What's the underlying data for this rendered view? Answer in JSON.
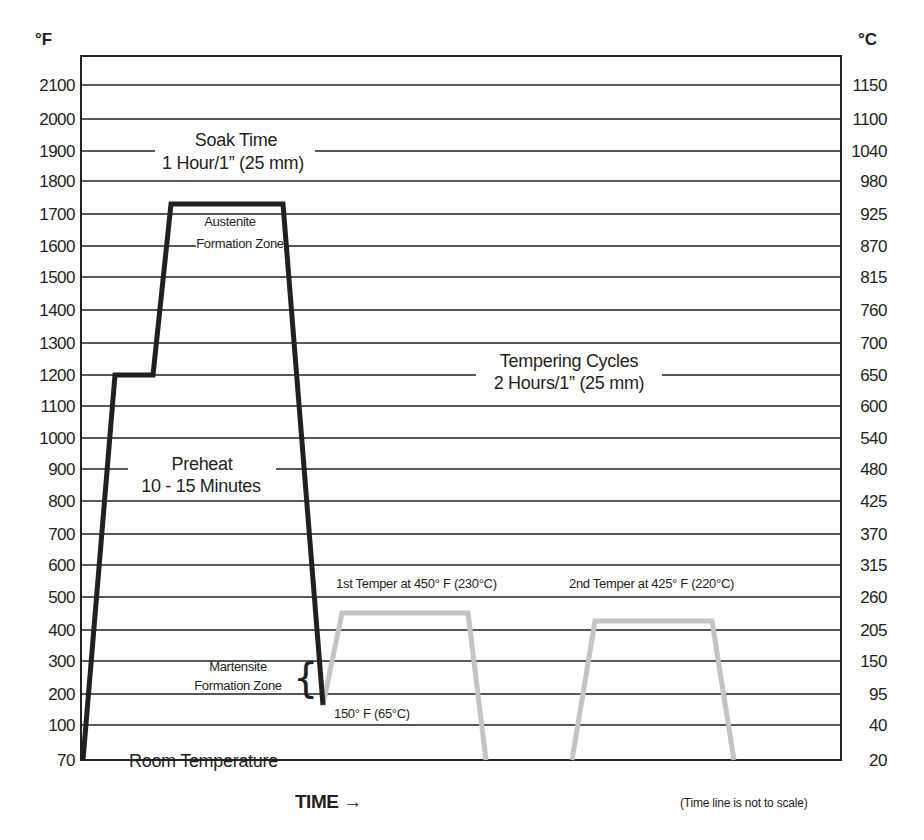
{
  "chart_data": {
    "type": "line",
    "title": "",
    "xlabel": "TIME →",
    "ylabel_left": "°F",
    "ylabel_right": "°C",
    "note": "(Time line is not to scale)",
    "grid": true,
    "y_ticks_f": [
      70,
      100,
      200,
      300,
      400,
      500,
      600,
      700,
      800,
      900,
      1000,
      1100,
      1200,
      1300,
      1400,
      1500,
      1600,
      1700,
      1800,
      1900,
      2000,
      2100
    ],
    "y_ticks_c": [
      20,
      40,
      95,
      150,
      205,
      260,
      315,
      370,
      425,
      480,
      540,
      600,
      650,
      700,
      760,
      815,
      870,
      925,
      980,
      1040,
      1100,
      1150
    ],
    "ylim_f": [
      70,
      2200
    ],
    "series": [
      {
        "name": "Hardening cycle",
        "color": "#231f20",
        "points_f": [
          {
            "stage": "Room Temperature start",
            "temp_f": 70
          },
          {
            "stage": "Preheat",
            "temp_f": 1200
          },
          {
            "stage": "Preheat hold end",
            "temp_f": 1200
          },
          {
            "stage": "Austenite Formation (soak)",
            "temp_f": 1730
          },
          {
            "stage": "Soak end",
            "temp_f": 1730
          },
          {
            "stage": "Quench to",
            "temp_f": 150
          }
        ]
      },
      {
        "name": "1st Temper",
        "color": "#c8c8c8",
        "points_f": [
          {
            "stage": "start",
            "temp_f": 150
          },
          {
            "stage": "hold",
            "temp_f": 450
          },
          {
            "stage": "hold end",
            "temp_f": 450
          },
          {
            "stage": "cool",
            "temp_f": 70
          }
        ]
      },
      {
        "name": "2nd Temper",
        "color": "#c8c8c8",
        "points_f": [
          {
            "stage": "start",
            "temp_f": 70
          },
          {
            "stage": "hold",
            "temp_f": 425
          },
          {
            "stage": "hold end",
            "temp_f": 425
          },
          {
            "stage": "cool",
            "temp_f": 70
          }
        ]
      }
    ],
    "annotations": {
      "soak_time": [
        "Soak Time",
        "1 Hour/1” (25 mm)"
      ],
      "austenite": [
        "Austenite",
        "Formation Zone"
      ],
      "preheat": [
        "Preheat",
        "10 - 15 Minutes"
      ],
      "tempering": [
        "Tempering Cycles",
        "2 Hours/1” (25 mm)"
      ],
      "martensite": [
        "Martensite",
        "Formation Zone"
      ],
      "quench_temp": "150° F (65°C)",
      "first_temper": "1st Temper at 450° F (230°C)",
      "second_temper": "2nd Temper at 425° F (220°C)",
      "room_temp": "Room Temperature"
    }
  }
}
